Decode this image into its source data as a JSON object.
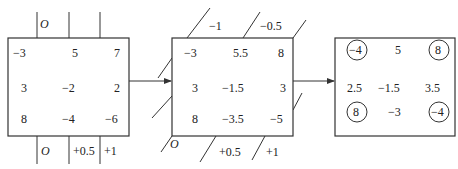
{
  "figure": {
    "box1": {
      "title": "initial",
      "cells": [
        [
          "−3",
          "5",
          "7"
        ],
        [
          "3",
          "−2",
          "2"
        ],
        [
          "8",
          "−4",
          "−6"
        ]
      ],
      "top_labels": [
        "O",
        "",
        ""
      ],
      "bottom_labels": [
        "O",
        "+0.5",
        "+1"
      ]
    },
    "box2": {
      "title": "after linear correction",
      "cells": [
        [
          "−3",
          "5.5",
          "8"
        ],
        [
          "3",
          "−1.5",
          "3"
        ],
        [
          "8",
          "−3.5",
          "−5"
        ]
      ],
      "top_labels": [
        "−1",
        "−0.5"
      ],
      "bottom_labels": [
        "O",
        "+0.5",
        "+1"
      ]
    },
    "box3": {
      "title": "result",
      "cells": [
        [
          "−4",
          "5",
          "8"
        ],
        [
          "2.5",
          "−1.5",
          "3.5"
        ],
        [
          "8",
          "−3",
          "−4"
        ]
      ],
      "circled": [
        "0.0",
        "0.2",
        "2.0",
        "2.2"
      ]
    },
    "arrows": [
      "box1-to-box2",
      "box2-to-box3"
    ]
  }
}
